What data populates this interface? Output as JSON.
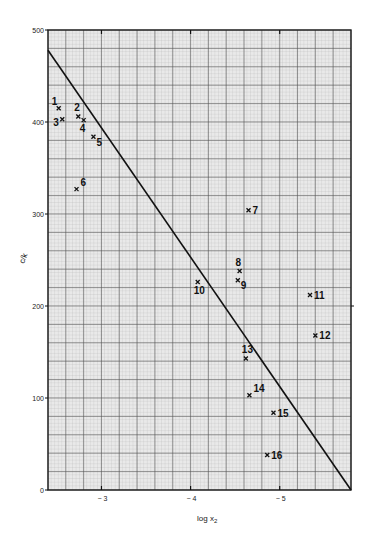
{
  "chart_data": {
    "type": "scatter",
    "title": "",
    "xlabel": "log x",
    "xlabel_sub": "2",
    "ylabel": "c/k",
    "xlim": [
      -2.4,
      -5.8
    ],
    "ylim": [
      0,
      500
    ],
    "grid": true,
    "x_ticks": [
      {
        "value": -3,
        "label": "− 3"
      },
      {
        "value": -4,
        "label": "− 4"
      },
      {
        "value": -5,
        "label": "− 5"
      }
    ],
    "y_ticks": [
      {
        "value": 0,
        "label": "0"
      },
      {
        "value": 100,
        "label": "100"
      },
      {
        "value": 200,
        "label": "200"
      },
      {
        "value": 300,
        "label": "300"
      },
      {
        "value": 400,
        "label": "400"
      },
      {
        "value": 500,
        "label": "500"
      }
    ],
    "marker": "x",
    "points": [
      {
        "label": "1",
        "x": -2.52,
        "y": 415,
        "pos": "tl"
      },
      {
        "label": "2",
        "x": -2.74,
        "y": 406,
        "pos": "t"
      },
      {
        "label": "3",
        "x": -2.56,
        "y": 403,
        "pos": "bl"
      },
      {
        "label": "4",
        "x": -2.8,
        "y": 402,
        "pos": "b"
      },
      {
        "label": "5",
        "x": -2.91,
        "y": 384,
        "pos": "br"
      },
      {
        "label": "6",
        "x": -2.72,
        "y": 327,
        "pos": "tr"
      },
      {
        "label": "7",
        "x": -4.65,
        "y": 304,
        "pos": "r"
      },
      {
        "label": "8",
        "x": -4.55,
        "y": 238,
        "pos": "t"
      },
      {
        "label": "9",
        "x": -4.53,
        "y": 228,
        "pos": "br"
      },
      {
        "label": "10",
        "x": -4.08,
        "y": 226,
        "pos": "b"
      },
      {
        "label": "11",
        "x": -5.34,
        "y": 212,
        "pos": "r"
      },
      {
        "label": "12",
        "x": -5.4,
        "y": 168,
        "pos": "r"
      },
      {
        "label": "13",
        "x": -4.62,
        "y": 143,
        "pos": "t"
      },
      {
        "label": "14",
        "x": -4.66,
        "y": 103,
        "pos": "tr"
      },
      {
        "label": "15",
        "x": -4.93,
        "y": 84,
        "pos": "r"
      },
      {
        "label": "16",
        "x": -4.86,
        "y": 38,
        "pos": "r"
      }
    ],
    "fit_line": {
      "x": [
        -2.4,
        -5.8
      ],
      "y": [
        478,
        0
      ]
    }
  }
}
